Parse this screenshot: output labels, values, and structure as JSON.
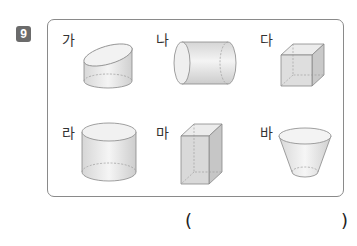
{
  "question": {
    "number": "9",
    "badge_color": "#6b6b6b"
  },
  "items": [
    {
      "label": "가",
      "shape": "cylinder-slanted-top"
    },
    {
      "label": "나",
      "shape": "cylinder-lying"
    },
    {
      "label": "다",
      "shape": "cube"
    },
    {
      "label": "라",
      "shape": "cylinder"
    },
    {
      "label": "마",
      "shape": "rectangular-prism"
    },
    {
      "label": "바",
      "shape": "truncated-cone"
    }
  ],
  "answer": {
    "open_paren": "(",
    "close_paren": ")",
    "value": ""
  }
}
